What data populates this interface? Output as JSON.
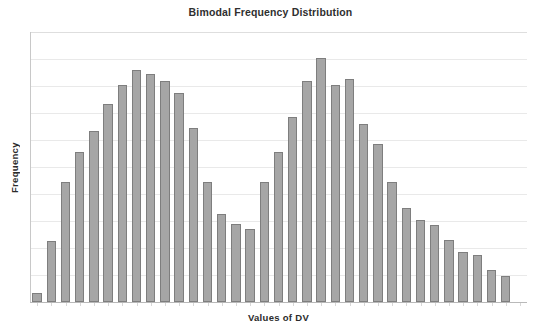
{
  "chart_data": {
    "type": "bar",
    "title": "Bimodal Frequency Distribution",
    "subtitle": "",
    "xlabel": "Values of DV",
    "ylabel": "Frequency",
    "grid": true,
    "gridline_count": 10,
    "legend": null,
    "legend_position": "none",
    "xtick_labels": [],
    "ytick_labels": [],
    "ylim": [
      0,
      10
    ],
    "bar_color": "#a6a6a6",
    "bar_edge_color": "#7e7e7e",
    "gridline_color": "#e9e9e9",
    "axis_color": "#c8c8c8",
    "categories": [
      "1",
      "2",
      "3",
      "4",
      "5",
      "6",
      "7",
      "8",
      "9",
      "10",
      "11",
      "12",
      "13",
      "14",
      "15",
      "16",
      "17",
      "18",
      "19",
      "20",
      "21",
      "22",
      "23",
      "24",
      "25",
      "26",
      "27",
      "28",
      "29",
      "30",
      "31",
      "32",
      "33",
      "34",
      "35"
    ],
    "values": [
      0.35,
      2.25,
      4.45,
      5.55,
      6.35,
      7.35,
      8.05,
      8.6,
      8.45,
      8.2,
      7.75,
      6.45,
      4.45,
      3.25,
      2.9,
      2.7,
      4.45,
      5.55,
      6.85,
      8.2,
      9.05,
      8.05,
      8.25,
      6.6,
      5.85,
      4.45,
      3.5,
      3.05,
      2.85,
      2.3,
      1.85,
      1.75,
      1.2,
      0.95,
      0.0
    ]
  },
  "title": {
    "text": "Bimodal Frequency Distribution"
  },
  "axes": {
    "x_label": "Values of DV",
    "y_label": "Frequency"
  }
}
